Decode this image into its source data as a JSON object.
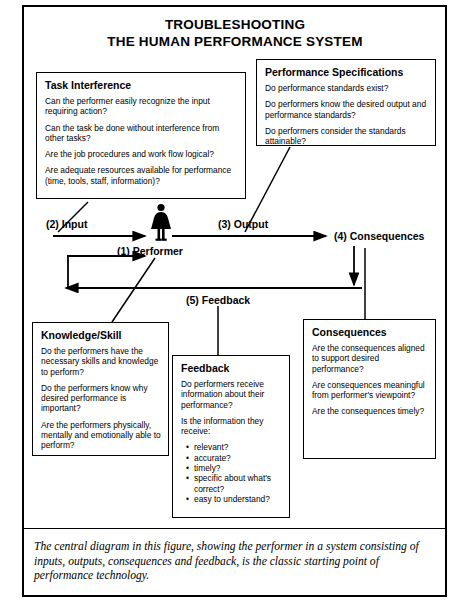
{
  "title": {
    "line1": "TROUBLESHOOTING",
    "line2": "THE HUMAN PERFORMANCE SYSTEM"
  },
  "boxes": {
    "task_interference": {
      "heading": "Task Interference",
      "questions": [
        "Can the performer easily recognize the input requiring action?",
        "Can the task be done without interference from other tasks?",
        "Are the job procedures and work flow logical?",
        "Are adequate resources available for performance (time, tools, staff, information)?"
      ]
    },
    "performance_specifications": {
      "heading": "Performance Specifications",
      "questions": [
        "Do performance standards exist?",
        "Do performers know the desired output and performance standards?",
        "Do performers consider the standards attainable?"
      ]
    },
    "knowledge_skill": {
      "heading": "Knowledge/Skill",
      "questions": [
        "Do the performers have the necessary skills and knowledge to perform?",
        "Do the performers know why desired performance is important?",
        "Are the performers physically, mentally and emotionally able to perform?"
      ]
    },
    "feedback": {
      "heading": "Feedback",
      "questions": [
        "Do performers receive information about their performance?",
        "Is the information they receive:"
      ],
      "bullets": [
        "relevant?",
        "accurate?",
        "timely?",
        "specific about what's correct?",
        "easy to understand?"
      ]
    },
    "consequences": {
      "heading": "Consequences",
      "questions": [
        "Are the consequences aligned to support desired performance?",
        "Are consequences meaningful from performer's viewpoint?",
        "Are the consequences timely?"
      ]
    }
  },
  "flow": {
    "input": "(2) Input",
    "output": "(3) Output",
    "consequences": "(4) Consequences",
    "performer": "(1) Performer",
    "feedback": "(5) Feedback"
  },
  "caption": "The central diagram in this figure, showing the performer in a system consisting of inputs, outputs, consequences and feedback, is the classic starting point of performance technology.",
  "colors": {
    "ink": "#000000",
    "paper": "#ffffff"
  }
}
